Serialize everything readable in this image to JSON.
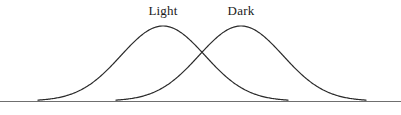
{
  "figure": {
    "background_color": "#ffffff",
    "width": 401,
    "height": 115
  },
  "labels": {
    "light": "Light",
    "dark": "Dark"
  },
  "chart_data": {
    "type": "line",
    "title": "",
    "xlabel": "",
    "ylabel": "",
    "grid": false,
    "legend_position": "inline-above-peaks",
    "axis": {
      "baseline_y_px": 101,
      "baseline_x_start_px": 0,
      "baseline_x_end_px": 401,
      "baseline_color": "#6f6f6f",
      "baseline_width_px": 1,
      "y_axis_visible": false,
      "x_axis_visible": true,
      "xlim_px": [
        0,
        401
      ],
      "ylim_px": [
        101,
        26
      ]
    },
    "series": [
      {
        "name": "Light",
        "label_text": "Light",
        "label_x_px": 163,
        "label_y_px": 4,
        "distribution": "normal",
        "mean_px": 163,
        "sigma_px": 42,
        "peak_x_px": 163,
        "peak_y_px": 26,
        "start_x_px": 38,
        "end_x_px": 288,
        "amplitude_px": 75,
        "stroke_color": "#2a2a2a",
        "stroke_width_px": 1.2,
        "fill": "none"
      },
      {
        "name": "Dark",
        "label_text": "Dark",
        "label_x_px": 241,
        "label_y_px": 4,
        "distribution": "normal",
        "mean_px": 241,
        "sigma_px": 42,
        "peak_x_px": 241,
        "peak_y_px": 26,
        "start_x_px": 116,
        "end_x_px": 366,
        "amplitude_px": 75,
        "stroke_color": "#2a2a2a",
        "stroke_width_px": 1.2,
        "fill": "none"
      }
    ],
    "annotations": [
      {
        "name": "curve-intersection",
        "x_px": 202,
        "y_px": 45,
        "text": ""
      }
    ]
  }
}
